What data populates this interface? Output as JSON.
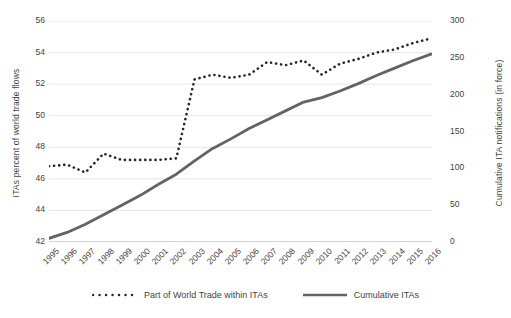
{
  "chart_data": {
    "type": "line",
    "title": "",
    "xlabel": "",
    "ylabel": "ITAs percent of world trade flows",
    "y2label": "Cumulative ITA notifications (in force)",
    "grid": true,
    "legend_position": "bottom",
    "categories": [
      "1995",
      "1996",
      "1997",
      "1998",
      "1999",
      "2000",
      "2001",
      "2002",
      "2003",
      "2004",
      "2005",
      "2006",
      "2007",
      "2008",
      "2009",
      "2010",
      "2011",
      "2012",
      "2013",
      "2014",
      "2015",
      "2016"
    ],
    "xlim": [
      1995,
      2016
    ],
    "ylim": [
      42,
      56
    ],
    "y2lim": [
      0,
      300
    ],
    "yticks": [
      42,
      44,
      46,
      48,
      50,
      52,
      54,
      56
    ],
    "y2ticks": [
      0,
      50,
      100,
      150,
      200,
      250,
      300
    ],
    "series": [
      {
        "name": "Part of World Trade within ITAs",
        "axis": "left",
        "style": "dotted",
        "color": "#262626",
        "values": [
          46.8,
          46.9,
          46.4,
          47.6,
          47.2,
          47.2,
          47.2,
          47.3,
          52.3,
          52.6,
          52.4,
          52.6,
          53.4,
          53.2,
          53.5,
          52.6,
          53.3,
          53.6,
          54.0,
          54.2,
          54.6,
          54.9
        ]
      },
      {
        "name": "Cumulative ITAs",
        "axis": "right",
        "style": "solid",
        "color": "#636363",
        "values": [
          5,
          13,
          24,
          37,
          50,
          63,
          78,
          92,
          110,
          127,
          140,
          154,
          166,
          178,
          190,
          196,
          205,
          215,
          226,
          236,
          246,
          255
        ]
      }
    ]
  },
  "legend": {
    "items": [
      {
        "label": "Part of World Trade within ITAs",
        "marker": "dotted-line-swatch"
      },
      {
        "label": "Cumulative ITAs",
        "marker": "solid-line-swatch"
      }
    ]
  }
}
